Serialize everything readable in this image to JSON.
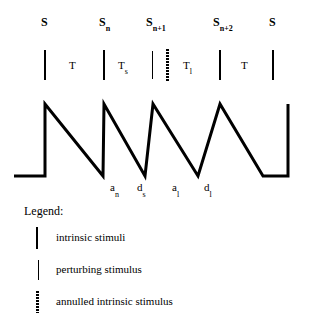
{
  "figure": {
    "type": "stimulus-timing-diagram",
    "background_color": "#ffffff",
    "ink_color": "#000000"
  },
  "stimulus_row": {
    "markers": [
      {
        "id": "s-first",
        "base": "S",
        "sub": "",
        "kind": "intrinsic",
        "x": 44,
        "label_x": 41,
        "label_y": 16
      },
      {
        "id": "s-n",
        "base": "S",
        "sub": "n",
        "kind": "intrinsic",
        "x": 103,
        "label_x": 99,
        "label_y": 16
      },
      {
        "id": "s-n-plus-1",
        "base": "S",
        "sub": "n+1",
        "kind": "perturbing",
        "x": 152,
        "label_x": 146,
        "label_y": 16
      },
      {
        "id": "s-annulled",
        "base": "",
        "sub": "",
        "kind": "annulled",
        "x": 167,
        "label_x": 0,
        "label_y": 0
      },
      {
        "id": "s-n-plus-2",
        "base": "S",
        "sub": "n+2",
        "kind": "intrinsic",
        "x": 219,
        "label_x": 213,
        "label_y": 16
      },
      {
        "id": "s-last",
        "base": "S",
        "sub": "",
        "kind": "intrinsic",
        "x": 272,
        "label_x": 269,
        "label_y": 16
      }
    ],
    "bar_top": 50,
    "bar_height": 30,
    "intervals": [
      {
        "id": "interval-T-1",
        "base": "T",
        "sub": "",
        "x": 69,
        "y": 60
      },
      {
        "id": "interval-Ts",
        "base": "T",
        "sub": "s",
        "x": 118,
        "y": 60
      },
      {
        "id": "interval-Tl",
        "base": "T",
        "sub": "l",
        "x": 183,
        "y": 60
      },
      {
        "id": "interval-T-2",
        "base": "T",
        "sub": "",
        "x": 241,
        "y": 60
      }
    ]
  },
  "chart_data": {
    "type": "line",
    "title": "",
    "xlabel": "",
    "ylabel": "",
    "grid": false,
    "legend_position": "below",
    "baseline_y": 176,
    "peak_y": 104,
    "points": [
      [
        14,
        176
      ],
      [
        45,
        176
      ],
      [
        45,
        104
      ],
      [
        103,
        176
      ],
      [
        103,
        176
      ],
      [
        104,
        104
      ],
      [
        145,
        176
      ],
      [
        145,
        176
      ],
      [
        153,
        104
      ],
      [
        198,
        176
      ],
      [
        198,
        176
      ],
      [
        220,
        104
      ],
      [
        263,
        176
      ],
      [
        263,
        176
      ],
      [
        288,
        176
      ],
      [
        288,
        104
      ]
    ],
    "stroke_width": 3
  },
  "phase_labels": [
    {
      "id": "a-n",
      "base": "a",
      "sub": "n",
      "x": 110,
      "y": 182
    },
    {
      "id": "d-s",
      "base": "d",
      "sub": "s",
      "x": 137,
      "y": 182
    },
    {
      "id": "a-l",
      "base": "a",
      "sub": "l",
      "x": 172,
      "y": 182
    },
    {
      "id": "d-l",
      "base": "d",
      "sub": "l",
      "x": 204,
      "y": 182
    }
  ],
  "legend": {
    "title": "Legend:",
    "rows": [
      {
        "id": "legend-intrinsic",
        "swatch": "solid-bar",
        "text": "intrinsic stimuli",
        "y": 22
      },
      {
        "id": "legend-perturbing",
        "swatch": "double-bar",
        "text": "perturbing stimulus",
        "y": 54
      },
      {
        "id": "legend-annulled",
        "swatch": "dotted-bar",
        "text": "annulled intrinsic stimulus",
        "y": 86
      }
    ]
  }
}
